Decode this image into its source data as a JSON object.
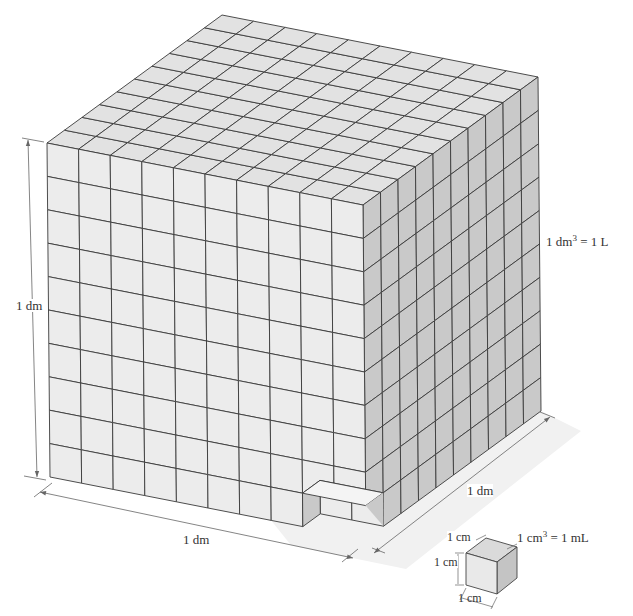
{
  "figure": {
    "big_cube": {
      "subdivisions_per_edge": 10,
      "height_label": "1 dm",
      "width_label": "1 dm",
      "depth_label": "1 dm",
      "equation_lhs": "1 dm",
      "equation_exp": "3",
      "equation_rhs": "= 1 L"
    },
    "small_cube": {
      "top_label": "1 cm",
      "height_label": "1 cm",
      "bottom_label": "1 cm",
      "equation_lhs": "1 cm",
      "equation_exp": "3",
      "equation_rhs": "= 1 mL"
    },
    "colors": {
      "top_face": "#e2e2e2",
      "front_face": "#ececec",
      "right_face": "#c9c9c9",
      "grid_line": "#3a3a3a",
      "dimension_line": "#666666"
    }
  }
}
